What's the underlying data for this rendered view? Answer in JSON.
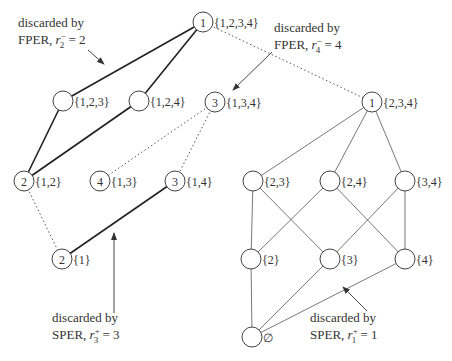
{
  "nodes": [
    {
      "id": "n1234",
      "set": "{1,2,3,4}",
      "rank": "1",
      "x": 203,
      "y": 22
    },
    {
      "id": "n123",
      "set": "{1,2,3}",
      "rank": "",
      "x": 63,
      "y": 101
    },
    {
      "id": "n124",
      "set": "{1,2,4}",
      "rank": "",
      "x": 139,
      "y": 101
    },
    {
      "id": "n134",
      "set": "{1,3,4}",
      "rank": "3",
      "x": 215,
      "y": 102
    },
    {
      "id": "n234",
      "set": "{2,3,4}",
      "rank": "1",
      "x": 372,
      "y": 102
    },
    {
      "id": "n12",
      "set": "{1,2}",
      "rank": "2",
      "x": 24,
      "y": 181
    },
    {
      "id": "n13",
      "set": "{1,3}",
      "rank": "4",
      "x": 100,
      "y": 181
    },
    {
      "id": "n14",
      "set": "{1,4}",
      "rank": "3",
      "x": 175,
      "y": 181
    },
    {
      "id": "n23",
      "set": "{2,3}",
      "rank": "",
      "x": 253,
      "y": 181
    },
    {
      "id": "n24",
      "set": "{2,4}",
      "rank": "",
      "x": 330,
      "y": 181
    },
    {
      "id": "n34",
      "set": "{3,4}",
      "rank": "",
      "x": 405,
      "y": 181
    },
    {
      "id": "n1",
      "set": "{1}",
      "rank": "2",
      "x": 62,
      "y": 259
    },
    {
      "id": "n2",
      "set": "{2}",
      "rank": "",
      "x": 251,
      "y": 259
    },
    {
      "id": "n3",
      "set": "{3}",
      "rank": "",
      "x": 330,
      "y": 259
    },
    {
      "id": "n4",
      "set": "{4}",
      "rank": "",
      "x": 405,
      "y": 259
    },
    {
      "id": "n0",
      "set": "∅",
      "rank": "",
      "x": 252,
      "y": 337
    }
  ],
  "edges": {
    "thick": [
      [
        "n1234",
        "n123"
      ],
      [
        "n1234",
        "n124"
      ],
      [
        "n123",
        "n12"
      ],
      [
        "n124",
        "n12"
      ],
      [
        "n14",
        "n1"
      ]
    ],
    "dotted": [
      [
        "n1234",
        "n234"
      ],
      [
        "n134",
        "n13"
      ],
      [
        "n134",
        "n14"
      ],
      [
        "n12",
        "n1"
      ]
    ],
    "thin": [
      [
        "n234",
        "n23"
      ],
      [
        "n234",
        "n24"
      ],
      [
        "n234",
        "n34"
      ],
      [
        "n23",
        "n2"
      ],
      [
        "n23",
        "n3"
      ],
      [
        "n24",
        "n2"
      ],
      [
        "n24",
        "n4"
      ],
      [
        "n34",
        "n3"
      ],
      [
        "n34",
        "n4"
      ],
      [
        "n2",
        "n0"
      ],
      [
        "n3",
        "n0"
      ],
      [
        "n4",
        "n0"
      ]
    ]
  },
  "annotations": [
    {
      "id": "fper2",
      "line1": "discarded by",
      "line2_prefix": "FPER, ",
      "var": "r",
      "sup": "−",
      "sub": "2",
      "value": " = 2",
      "x": 18,
      "y": 27
    },
    {
      "id": "fper4",
      "line1": "discarded by",
      "line2_prefix": "FPER, ",
      "var": "r",
      "sup": "−",
      "sub": "4",
      "value": " = 4",
      "x": 274,
      "y": 32
    },
    {
      "id": "sper3",
      "line1": "discarded by",
      "line2_prefix": "SPER, ",
      "var": "r",
      "sup": "+",
      "sub": "3",
      "value": " = 3",
      "x": 52,
      "y": 322
    },
    {
      "id": "sper1",
      "line1": "discarded by",
      "line2_prefix": "SPER, ",
      "var": "r",
      "sup": "+",
      "sub": "1",
      "value": " = 1",
      "x": 310,
      "y": 322
    }
  ],
  "arrows": [
    {
      "id": "arrow-fper2",
      "x1": 88,
      "y1": 50,
      "x2": 104,
      "y2": 64
    },
    {
      "id": "arrow-fper4",
      "x1": 272,
      "y1": 52,
      "x2": 233,
      "y2": 90
    },
    {
      "id": "arrow-sper3",
      "x1": 114,
      "y1": 313,
      "x2": 114,
      "y2": 233
    },
    {
      "id": "arrow-sper1",
      "x1": 367,
      "y1": 311,
      "x2": 343,
      "y2": 287
    }
  ]
}
